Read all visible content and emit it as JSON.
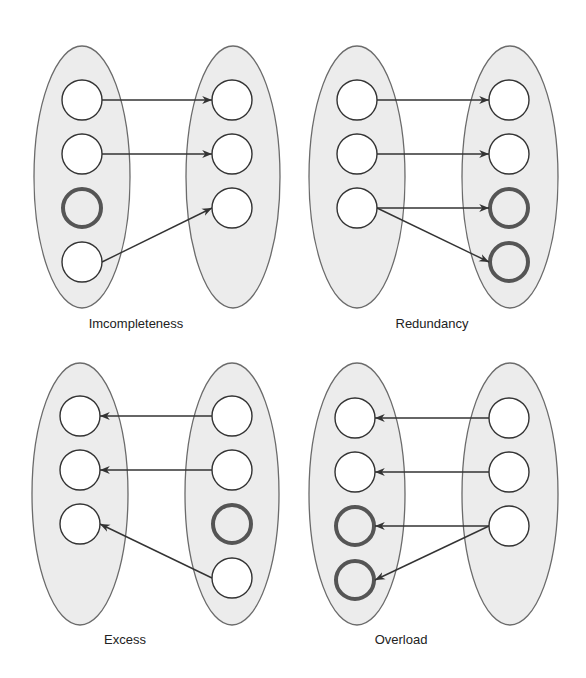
{
  "colors": {
    "ellipse_fill": "#ececec",
    "ellipse_stroke": "#6b6b6b",
    "node_fill": "#ffffff",
    "node_stroke": "#333333",
    "highlight_stroke": "#555555",
    "arrow": "#333333"
  },
  "panels": [
    {
      "id": "incompleteness",
      "label": "Imcompleteness",
      "label_pos": [
        136,
        328
      ],
      "ellipses": [
        {
          "cx": 82,
          "cy": 177,
          "rx": 48,
          "ry": 131
        },
        {
          "cx": 233,
          "cy": 177,
          "rx": 47,
          "ry": 131
        }
      ],
      "left_nodes": [
        {
          "cx": 82,
          "cy": 100,
          "highlight": false
        },
        {
          "cx": 82,
          "cy": 154,
          "highlight": false
        },
        {
          "cx": 82,
          "cy": 208,
          "highlight": true
        },
        {
          "cx": 82,
          "cy": 262,
          "highlight": false
        }
      ],
      "right_nodes": [
        {
          "cx": 232,
          "cy": 100,
          "highlight": false
        },
        {
          "cx": 232,
          "cy": 154,
          "highlight": false
        },
        {
          "cx": 232,
          "cy": 208,
          "highlight": false
        }
      ],
      "arrows": [
        {
          "from": [
            102,
            100
          ],
          "to": [
            212,
            100
          ]
        },
        {
          "from": [
            102,
            154
          ],
          "to": [
            212,
            154
          ]
        },
        {
          "from": [
            102,
            262
          ],
          "to": [
            212,
            208
          ]
        }
      ]
    },
    {
      "id": "redundancy",
      "label": "Redundancy",
      "label_pos": [
        432,
        328
      ],
      "ellipses": [
        {
          "cx": 357,
          "cy": 177,
          "rx": 48,
          "ry": 131
        },
        {
          "cx": 510,
          "cy": 177,
          "rx": 48,
          "ry": 131
        }
      ],
      "left_nodes": [
        {
          "cx": 357,
          "cy": 100,
          "highlight": false
        },
        {
          "cx": 357,
          "cy": 154,
          "highlight": false
        },
        {
          "cx": 357,
          "cy": 208,
          "highlight": false
        }
      ],
      "right_nodes": [
        {
          "cx": 509,
          "cy": 100,
          "highlight": false
        },
        {
          "cx": 509,
          "cy": 154,
          "highlight": false
        },
        {
          "cx": 509,
          "cy": 208,
          "highlight": true
        },
        {
          "cx": 509,
          "cy": 262,
          "highlight": true
        }
      ],
      "arrows": [
        {
          "from": [
            377,
            100
          ],
          "to": [
            489,
            100
          ]
        },
        {
          "from": [
            377,
            154
          ],
          "to": [
            489,
            154
          ]
        },
        {
          "from": [
            377,
            208
          ],
          "to": [
            489,
            208
          ]
        },
        {
          "from": [
            377,
            208
          ],
          "to": [
            489,
            262
          ]
        }
      ]
    },
    {
      "id": "excess",
      "label": "Excess",
      "label_pos": [
        125,
        644
      ],
      "ellipses": [
        {
          "cx": 80,
          "cy": 494,
          "rx": 48,
          "ry": 131
        },
        {
          "cx": 232,
          "cy": 494,
          "rx": 47,
          "ry": 131
        }
      ],
      "left_nodes": [
        {
          "cx": 80,
          "cy": 416,
          "highlight": false
        },
        {
          "cx": 80,
          "cy": 470,
          "highlight": false
        },
        {
          "cx": 80,
          "cy": 524,
          "highlight": false
        }
      ],
      "right_nodes": [
        {
          "cx": 232,
          "cy": 416,
          "highlight": false
        },
        {
          "cx": 232,
          "cy": 470,
          "highlight": false
        },
        {
          "cx": 232,
          "cy": 524,
          "highlight": true
        },
        {
          "cx": 232,
          "cy": 578,
          "highlight": false
        }
      ],
      "arrows": [
        {
          "from": [
            212,
            416
          ],
          "to": [
            100,
            416
          ]
        },
        {
          "from": [
            212,
            470
          ],
          "to": [
            100,
            470
          ]
        },
        {
          "from": [
            212,
            578
          ],
          "to": [
            100,
            524
          ]
        }
      ]
    },
    {
      "id": "overload",
      "label": "Overload",
      "label_pos": [
        401,
        644
      ],
      "ellipses": [
        {
          "cx": 357,
          "cy": 494,
          "rx": 48,
          "ry": 131
        },
        {
          "cx": 510,
          "cy": 494,
          "rx": 48,
          "ry": 131
        }
      ],
      "left_nodes": [
        {
          "cx": 355,
          "cy": 418,
          "highlight": false
        },
        {
          "cx": 355,
          "cy": 472,
          "highlight": false
        },
        {
          "cx": 355,
          "cy": 526,
          "highlight": true
        },
        {
          "cx": 355,
          "cy": 580,
          "highlight": true
        }
      ],
      "right_nodes": [
        {
          "cx": 509,
          "cy": 418,
          "highlight": false
        },
        {
          "cx": 509,
          "cy": 472,
          "highlight": false
        },
        {
          "cx": 509,
          "cy": 526,
          "highlight": false
        }
      ],
      "arrows": [
        {
          "from": [
            489,
            418
          ],
          "to": [
            375,
            418
          ]
        },
        {
          "from": [
            489,
            472
          ],
          "to": [
            375,
            472
          ]
        },
        {
          "from": [
            489,
            526
          ],
          "to": [
            375,
            526
          ]
        },
        {
          "from": [
            489,
            526
          ],
          "to": [
            375,
            580
          ]
        }
      ]
    }
  ],
  "node_radius": 20
}
